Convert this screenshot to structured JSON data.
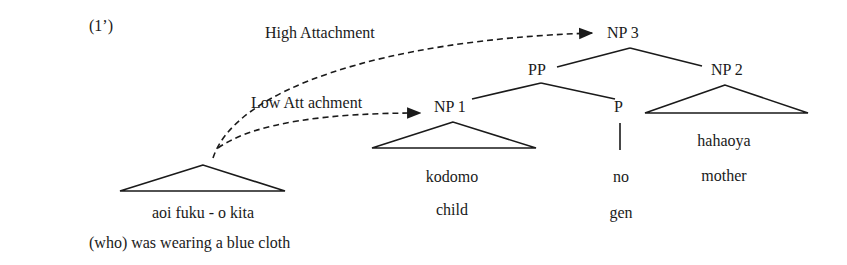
{
  "example_number": "(1’)",
  "arrows": {
    "high": "High  Attachment",
    "low": "Low Att achment"
  },
  "nodes": {
    "np3": "NP 3",
    "pp": "PP",
    "np2": "NP 2",
    "np1": "NP 1",
    "p": "P"
  },
  "leaves": {
    "relative_clause": {
      "japanese": "aoi fuku - o kita",
      "gloss": "(who) was wearing a blue cloth"
    },
    "np1": {
      "japanese": "kodomo",
      "gloss": "child"
    },
    "p": {
      "japanese": "no",
      "gloss": "gen"
    },
    "np2": {
      "japanese": "hahaoya",
      "gloss": "mother"
    }
  }
}
